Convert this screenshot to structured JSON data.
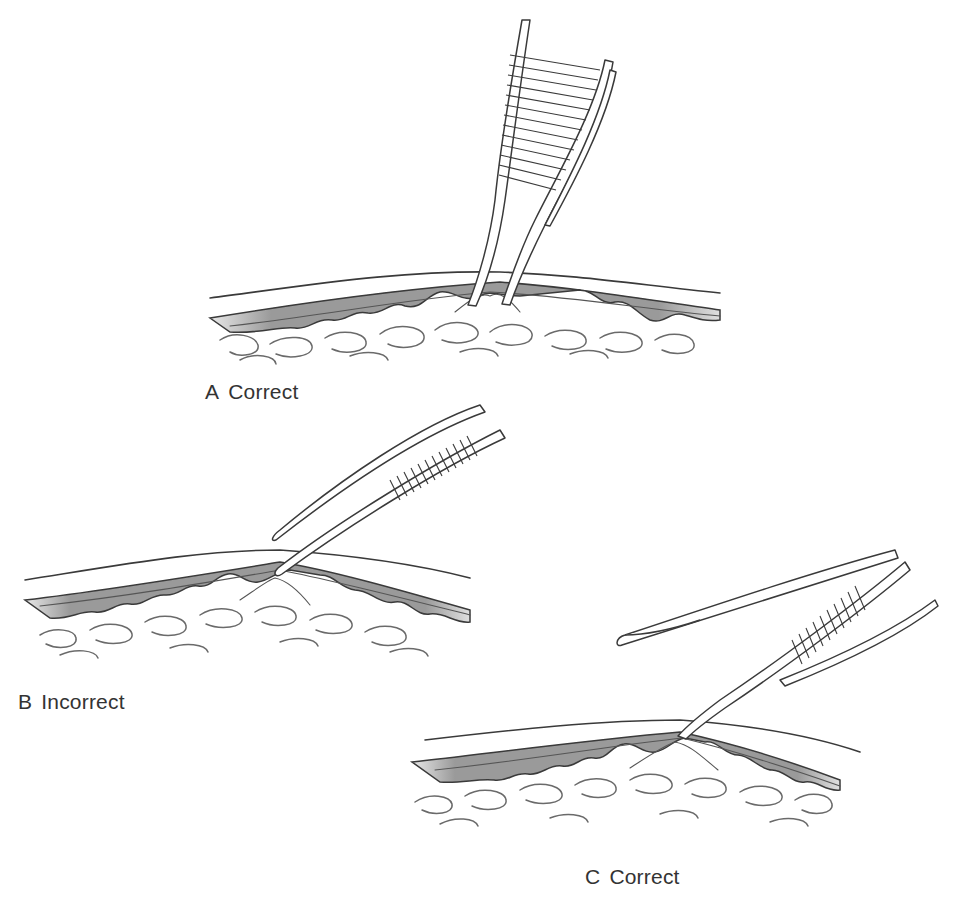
{
  "figure": {
    "panels": [
      {
        "id": "A",
        "letter": "A",
        "label": "Correct",
        "description": "Forceps held perpendicular, grasping subcutaneous tissue beneath skin edge"
      },
      {
        "id": "B",
        "letter": "B",
        "label": "Incorrect",
        "description": "Forceps angled flat, crushing dermis/skin edge"
      },
      {
        "id": "C",
        "letter": "C",
        "label": "Correct",
        "description": "Toothed forceps at angle grasping dermal edge; second instrument retracting"
      }
    ],
    "colors": {
      "line": "#3a3a3a",
      "dermis_fill": "#9a9a9a",
      "background": "#ffffff",
      "caption_text": "#333333"
    }
  }
}
